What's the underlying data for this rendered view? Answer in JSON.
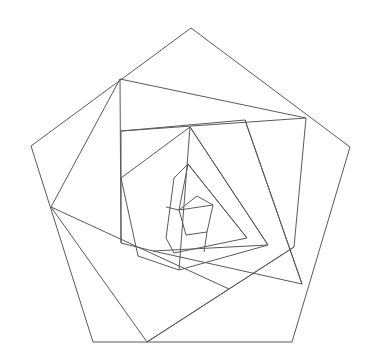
{
  "figure": {
    "canvas": {
      "width": 380,
      "height": 364
    },
    "background_color": "#ffffff",
    "stroke_color": "#5a5a5a",
    "stroke_width": 1,
    "fill": "none",
    "shape_type": "pentagon",
    "sides": 5,
    "nesting_levels": 6
  },
  "chart_data": {
    "type": "diagram",
    "grid": false,
    "legend": null,
    "xlabel": "",
    "ylabel": "",
    "xlim": [
      0,
      380
    ],
    "ylim": [
      0,
      364
    ],
    "polygons": [
      {
        "name": "pentagon-level-1",
        "level": 1,
        "closed": true,
        "points": [
          [
            191,
            28
          ],
          [
            350,
            147
          ],
          [
            292,
            342
          ],
          [
            93,
            342
          ],
          [
            31,
            146
          ]
        ]
      },
      {
        "name": "pentagon-level-2",
        "level": 2,
        "closed": true,
        "points": [
          [
            120,
            79
          ],
          [
            306,
            118
          ],
          [
            294,
            247
          ],
          [
            147,
            342
          ],
          [
            51,
            207
          ]
        ]
      },
      {
        "name": "pentagon-level-3",
        "level": 3,
        "closed": true,
        "points": [
          [
            121,
            131
          ],
          [
            245,
            120
          ],
          [
            302,
            284
          ],
          [
            153,
            251
          ],
          [
            121,
            243
          ]
        ]
      },
      {
        "name": "pentagon-level-4",
        "level": 4,
        "closed": true,
        "points": [
          [
            190,
            127
          ],
          [
            268,
            245
          ],
          [
            179,
            270
          ],
          [
            138,
            256
          ],
          [
            121,
            178
          ]
        ]
      },
      {
        "name": "pentagon-level-5",
        "level": 5,
        "closed": true,
        "points": [
          [
            188,
            164
          ],
          [
            247,
            238
          ],
          [
            174,
            253
          ],
          [
            166,
            238
          ],
          [
            174,
            178
          ]
        ]
      },
      {
        "name": "pentagon-level-6",
        "level": 6,
        "closed": true,
        "points": [
          [
            197,
            196
          ],
          [
            213,
            205
          ],
          [
            207,
            232
          ],
          [
            186,
            235
          ],
          [
            179,
            210
          ]
        ]
      }
    ],
    "chords": [
      {
        "name": "chord-left-vertical",
        "points": [
          [
            120,
            79
          ],
          [
            121,
            243
          ]
        ]
      },
      {
        "name": "chord-upper-horizontal",
        "points": [
          [
            121,
            131
          ],
          [
            306,
            118
          ]
        ]
      },
      {
        "name": "chord-right-descend",
        "points": [
          [
            245,
            120
          ],
          [
            302,
            284
          ]
        ]
      },
      {
        "name": "chord-lower-left",
        "points": [
          [
            51,
            207
          ],
          [
            229,
            289
          ]
        ]
      },
      {
        "name": "chord-bottom-diagonal",
        "points": [
          [
            147,
            342
          ],
          [
            294,
            247
          ]
        ]
      },
      {
        "name": "chord-inner-left-vertical",
        "points": [
          [
            190,
            127
          ],
          [
            179,
            270
          ]
        ]
      },
      {
        "name": "chord-inner-diagonal",
        "points": [
          [
            190,
            127
          ],
          [
            268,
            245
          ]
        ]
      },
      {
        "name": "chord-inner-base",
        "points": [
          [
            153,
            251
          ],
          [
            268,
            245
          ]
        ]
      },
      {
        "name": "chord-core-upper-left",
        "points": [
          [
            188,
            164
          ],
          [
            179,
            210
          ]
        ]
      },
      {
        "name": "chord-core-diagonal",
        "points": [
          [
            188,
            164
          ],
          [
            247,
            238
          ]
        ]
      },
      {
        "name": "chord-core-left-spur",
        "points": [
          [
            166,
            207
          ],
          [
            179,
            210
          ]
        ]
      },
      {
        "name": "chord-core-down-spur",
        "points": [
          [
            207,
            232
          ],
          [
            204,
            252
          ]
        ]
      },
      {
        "name": "chord-core-right-spur",
        "points": [
          [
            213,
            205
          ],
          [
            179,
            210
          ]
        ]
      }
    ]
  }
}
